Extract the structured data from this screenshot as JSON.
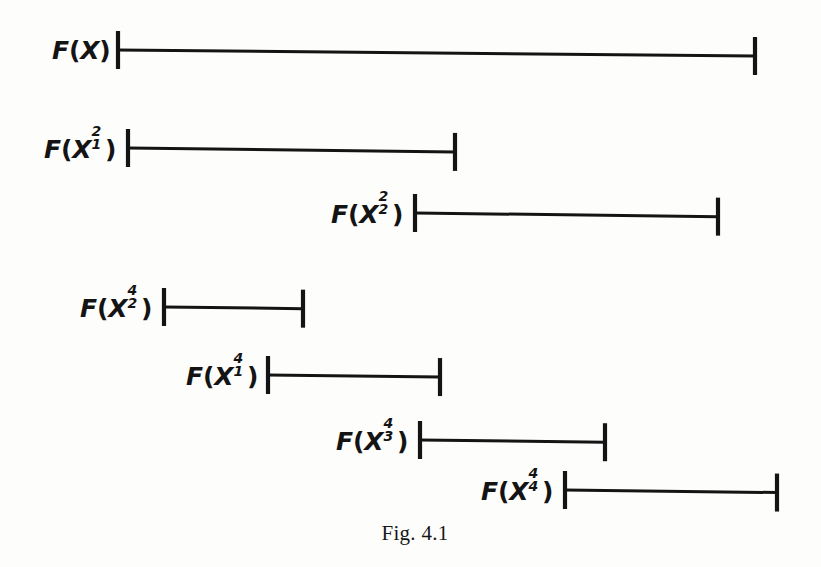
{
  "figure": {
    "caption": "Fig. 4.1",
    "caption_x": 415,
    "caption_y": 533,
    "background_color": "#fdfdfc",
    "ink_color": "#141414",
    "width": 821,
    "height": 567
  },
  "chart_data": {
    "type": "interval",
    "title": "Fig. 4.1",
    "xlabel": "",
    "ylabel": "",
    "grid": false,
    "legend": "none",
    "intervals": [
      {
        "label": "F(X)",
        "function": "F",
        "variable": "X",
        "superscript": "",
        "subscript": "",
        "x_start": 118,
        "x_end": 755,
        "y": 50,
        "label_x": 52,
        "label_y": 50,
        "width": 637
      },
      {
        "label": "F(X_1^2)",
        "function": "F",
        "variable": "X",
        "superscript": "2",
        "subscript": "1",
        "x_start": 128,
        "x_end": 455,
        "y": 148,
        "label_x": 44,
        "label_y": 148,
        "width": 327
      },
      {
        "label": "F(X_2^2)",
        "function": "F",
        "variable": "X",
        "superscript": "2",
        "subscript": "2",
        "x_start": 415,
        "x_end": 718,
        "y": 213,
        "label_x": 331,
        "label_y": 213,
        "width": 303
      },
      {
        "label": "F(X_2^4)",
        "function": "F",
        "variable": "X",
        "superscript": "4",
        "subscript": "2",
        "x_start": 164,
        "x_end": 303,
        "y": 307,
        "label_x": 80,
        "label_y": 307,
        "width": 139
      },
      {
        "label": "F(X_1^4)",
        "function": "F",
        "variable": "X",
        "superscript": "4",
        "subscript": "1",
        "x_start": 268,
        "x_end": 440,
        "y": 375,
        "label_x": 186,
        "label_y": 375,
        "width": 172
      },
      {
        "label": "F(X_3^4)",
        "function": "F",
        "variable": "X",
        "superscript": "4",
        "subscript": "3",
        "x_start": 420,
        "x_end": 605,
        "y": 440,
        "label_x": 336,
        "label_y": 440,
        "width": 185
      },
      {
        "label": "F(X_4^4)",
        "function": "F",
        "variable": "X",
        "superscript": "4",
        "subscript": "4",
        "x_start": 565,
        "x_end": 777,
        "y": 490,
        "label_x": 481,
        "label_y": 490,
        "width": 212
      }
    ]
  }
}
